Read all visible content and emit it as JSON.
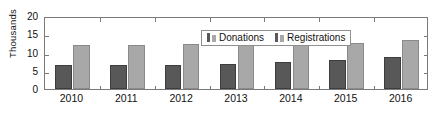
{
  "chart_data": {
    "type": "bar",
    "title": "",
    "xlabel": "",
    "ylabel": "Thousands",
    "categories": [
      "2010",
      "2011",
      "2012",
      "2013",
      "2014",
      "2015",
      "2016"
    ],
    "series": [
      {
        "name": "Donations",
        "values": [
          6.5,
          6.6,
          6.7,
          6.9,
          7.3,
          7.9,
          8.9
        ],
        "color": "#585858"
      },
      {
        "name": "Registrations",
        "values": [
          12.0,
          12.0,
          12.3,
          12.5,
          12.6,
          12.7,
          13.4
        ],
        "color": "#a8a8a8"
      }
    ],
    "ylim": [
      0,
      20
    ],
    "yticks": [
      "0",
      "5",
      "10",
      "15",
      "20"
    ],
    "grid": false,
    "legend_position": "top-right-inside",
    "ticks_on_all_borders": true
  },
  "legend": {
    "items": [
      {
        "label": "Donations",
        "swatch": "bar-swatch-dark-icon"
      },
      {
        "label": "Registrations",
        "swatch": "bar-swatch-light-icon"
      }
    ]
  }
}
